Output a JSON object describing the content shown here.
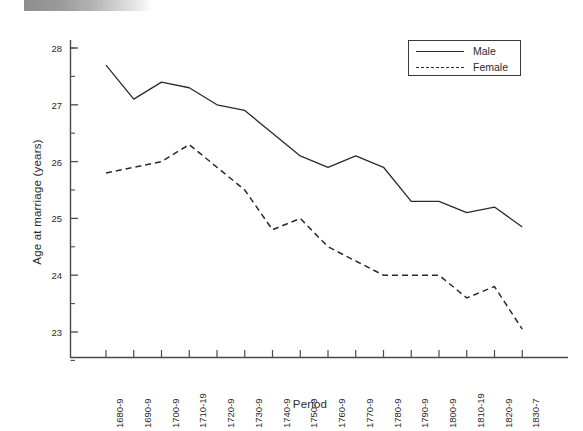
{
  "chart_data": {
    "type": "line",
    "title": "",
    "xlabel": "Period",
    "ylabel": "Age at marriage (years)",
    "categories": [
      "1680-9",
      "1690-9",
      "1700-9",
      "1710-19",
      "1720-9",
      "1730-9",
      "1740-9",
      "1750-9",
      "1760-9",
      "1770-9",
      "1780-9",
      "1790-9",
      "1800-9",
      "1810-19",
      "1820-9",
      "1830-7"
    ],
    "ylim": [
      22.5,
      28.3
    ],
    "yticks": [
      23,
      24,
      25,
      26,
      27,
      28
    ],
    "ytick_labels": [
      "23",
      "24",
      "25",
      "26",
      "27",
      "28"
    ],
    "yticks_minor": [
      22.5,
      23.5,
      24.5,
      25.5,
      26.5,
      27.5,
      28.0
    ],
    "grid": false,
    "legend_position": "top-right",
    "series": [
      {
        "name": "Male",
        "style": "solid",
        "color": "#2b2b2b",
        "values": [
          27.7,
          27.1,
          27.4,
          27.3,
          27.0,
          26.9,
          26.5,
          26.1,
          25.9,
          26.1,
          25.9,
          25.3,
          25.3,
          25.1,
          25.2,
          24.85
        ]
      },
      {
        "name": "Female",
        "style": "dashed",
        "color": "#2b2b2b",
        "values": [
          25.8,
          25.9,
          26.0,
          26.3,
          25.9,
          25.5,
          24.8,
          25.0,
          24.5,
          24.25,
          24.0,
          24.0,
          24.0,
          23.6,
          23.8,
          23.05
        ]
      }
    ]
  },
  "legend": {
    "entries": [
      {
        "label": "Male",
        "style": "solid"
      },
      {
        "label": "Female",
        "style": "dashed"
      }
    ]
  },
  "axes": {
    "x_title": "Period",
    "y_title": "Age at marriage (years)"
  },
  "colors": {
    "line": "#2b2b2b",
    "axis": "#4a4a4a",
    "background": "#ffffff"
  }
}
